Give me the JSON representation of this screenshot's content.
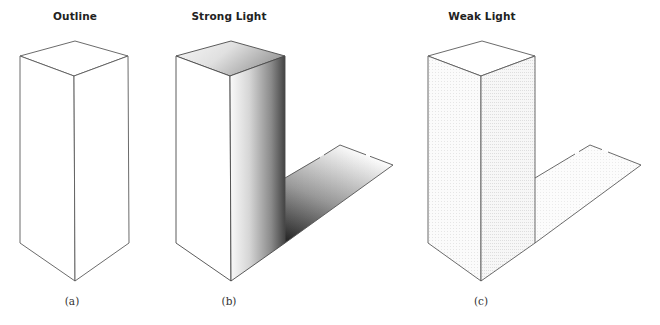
{
  "figure": {
    "panels": [
      {
        "id": "a",
        "title": "Outline",
        "caption": "(a)",
        "shading": "none"
      },
      {
        "id": "b",
        "title": "Strong Light",
        "caption": "(b)",
        "shading": "strong"
      },
      {
        "id": "c",
        "title": "Weak Light",
        "caption": "(c)",
        "shading": "weak"
      }
    ],
    "colors": {
      "background": "#ffffff",
      "stroke": "#555555",
      "strong_dark": "#3a3a3a",
      "strong_light": "#f4f4f4",
      "weak_tint": "#f3f3f3"
    }
  }
}
